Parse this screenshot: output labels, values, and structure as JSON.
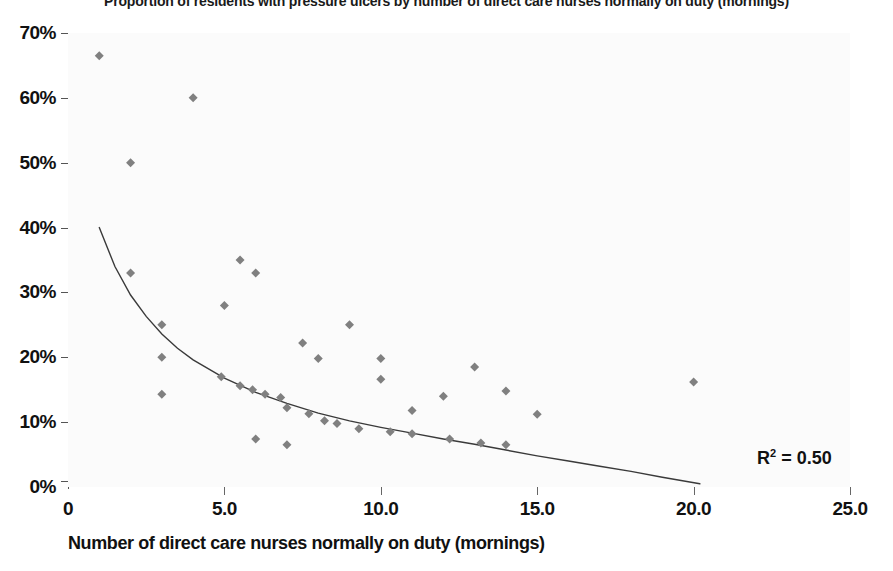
{
  "chart_data": {
    "type": "scatter",
    "title": "Proportion of residents with pressure ulcers by number of direct care nurses normally on duty (mornings)",
    "xlabel": "Number of direct care nurses normally on duty (mornings)",
    "ylabel": "",
    "xlim": [
      0,
      25
    ],
    "ylim": [
      0,
      70
    ],
    "xticks": [
      0,
      5,
      10,
      15,
      20,
      25
    ],
    "xtick_labels": [
      "0",
      "5.0",
      "10.0",
      "15.0",
      "20.0",
      "25.0"
    ],
    "yticks": [
      0,
      10,
      20,
      30,
      40,
      50,
      60,
      70
    ],
    "ytick_labels": [
      "0%",
      "10%",
      "20%",
      "30%",
      "40%",
      "50%",
      "60%",
      "70%"
    ],
    "grid": false,
    "legend": "none",
    "marker": {
      "shape": "diamond",
      "color": "#808080",
      "size": 9
    },
    "points": [
      {
        "x": 1.0,
        "y": 66.5
      },
      {
        "x": 2.0,
        "y": 50.0
      },
      {
        "x": 2.0,
        "y": 33.0
      },
      {
        "x": 4.0,
        "y": 60.0
      },
      {
        "x": 3.0,
        "y": 25.0
      },
      {
        "x": 3.0,
        "y": 20.0
      },
      {
        "x": 3.0,
        "y": 14.3
      },
      {
        "x": 5.5,
        "y": 35.0
      },
      {
        "x": 6.0,
        "y": 33.0
      },
      {
        "x": 5.0,
        "y": 28.0
      },
      {
        "x": 4.9,
        "y": 17.0
      },
      {
        "x": 5.5,
        "y": 15.6
      },
      {
        "x": 5.9,
        "y": 15.0
      },
      {
        "x": 6.3,
        "y": 14.3
      },
      {
        "x": 6.8,
        "y": 13.8
      },
      {
        "x": 7.0,
        "y": 12.2
      },
      {
        "x": 6.0,
        "y": 7.4
      },
      {
        "x": 7.0,
        "y": 6.5
      },
      {
        "x": 7.5,
        "y": 22.2
      },
      {
        "x": 8.0,
        "y": 19.8
      },
      {
        "x": 7.7,
        "y": 11.3
      },
      {
        "x": 8.2,
        "y": 10.2
      },
      {
        "x": 8.6,
        "y": 9.8
      },
      {
        "x": 9.0,
        "y": 25.0
      },
      {
        "x": 9.3,
        "y": 9.0
      },
      {
        "x": 10.0,
        "y": 19.8
      },
      {
        "x": 10.0,
        "y": 16.6
      },
      {
        "x": 10.3,
        "y": 8.5
      },
      {
        "x": 11.0,
        "y": 11.8
      },
      {
        "x": 11.0,
        "y": 8.2
      },
      {
        "x": 12.0,
        "y": 14.0
      },
      {
        "x": 12.2,
        "y": 7.4
      },
      {
        "x": 13.0,
        "y": 18.5
      },
      {
        "x": 13.2,
        "y": 6.8
      },
      {
        "x": 14.0,
        "y": 14.8
      },
      {
        "x": 14.0,
        "y": 6.5
      },
      {
        "x": 15.0,
        "y": 11.2
      },
      {
        "x": 20.0,
        "y": 16.2
      }
    ],
    "trendline": {
      "type": "power",
      "color": "#3a3a3a",
      "width": 1.4,
      "x_start": 1.0,
      "x_end": 20.2,
      "y_start": 40.0,
      "y_end": 0.5,
      "annotation": "R² = 0.50",
      "r_squared": 0.5,
      "points": [
        {
          "x": 1.0,
          "y": 40.0
        },
        {
          "x": 1.5,
          "y": 34.0
        },
        {
          "x": 2.0,
          "y": 29.6
        },
        {
          "x": 2.5,
          "y": 26.3
        },
        {
          "x": 3.0,
          "y": 23.6
        },
        {
          "x": 3.5,
          "y": 21.4
        },
        {
          "x": 4.0,
          "y": 19.6
        },
        {
          "x": 5.0,
          "y": 16.8
        },
        {
          "x": 6.0,
          "y": 14.6
        },
        {
          "x": 7.0,
          "y": 12.9
        },
        {
          "x": 8.0,
          "y": 11.4
        },
        {
          "x": 9.0,
          "y": 10.2
        },
        {
          "x": 10.0,
          "y": 9.2
        },
        {
          "x": 11.0,
          "y": 8.3
        },
        {
          "x": 12.0,
          "y": 7.4
        },
        {
          "x": 13.0,
          "y": 6.6
        },
        {
          "x": 14.0,
          "y": 5.7
        },
        {
          "x": 15.0,
          "y": 4.8
        },
        {
          "x": 16.0,
          "y": 4.0
        },
        {
          "x": 17.0,
          "y": 3.2
        },
        {
          "x": 18.0,
          "y": 2.4
        },
        {
          "x": 19.0,
          "y": 1.5
        },
        {
          "x": 20.2,
          "y": 0.5
        }
      ]
    }
  },
  "annotations": {
    "r2_prefix": "R",
    "r2_sup": "2",
    "r2_value": " = 0.50"
  },
  "colors": {
    "marker": "#808080",
    "trendline": "#3a3a3a",
    "axis_text": "#111111",
    "tick": "#555555",
    "plot_background": "#fbfbfb",
    "page_background": "#ffffff"
  }
}
